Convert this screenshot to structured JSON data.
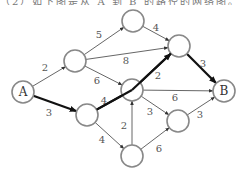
{
  "header": {
    "text": "（2）如下图是从 A 到 B 的路径的网络图。"
  },
  "graph": {
    "nodes": [
      {
        "id": "A",
        "label": "A",
        "x": 23,
        "y": 92
      },
      {
        "id": "N1",
        "label": "",
        "x": 75,
        "y": 61
      },
      {
        "id": "N2",
        "label": "",
        "x": 133,
        "y": 21
      },
      {
        "id": "N3",
        "label": "",
        "x": 179,
        "y": 46
      },
      {
        "id": "N4",
        "label": "",
        "x": 87,
        "y": 115
      },
      {
        "id": "N5",
        "label": "",
        "x": 132,
        "y": 90
      },
      {
        "id": "N6",
        "label": "",
        "x": 178,
        "y": 121
      },
      {
        "id": "N7",
        "label": "",
        "x": 132,
        "y": 156
      },
      {
        "id": "B",
        "label": "B",
        "x": 224,
        "y": 91
      }
    ],
    "edges": [
      {
        "from": "A",
        "to": "N1",
        "weight": "2",
        "bold": false,
        "lx": 45,
        "ly": 71
      },
      {
        "from": "N1",
        "to": "N2",
        "weight": "5",
        "bold": false,
        "lx": 99,
        "ly": 38
      },
      {
        "from": "N1",
        "to": "N3",
        "weight": "8",
        "bold": false,
        "lx": 126,
        "ly": 64
      },
      {
        "from": "N1",
        "to": "N5",
        "weight": "6",
        "bold": false,
        "lx": 97,
        "ly": 84
      },
      {
        "from": "N2",
        "to": "N3",
        "weight": "4",
        "bold": false,
        "lx": 156,
        "ly": 31
      },
      {
        "from": "A",
        "to": "N4",
        "weight": "3",
        "bold": true,
        "lx": 49,
        "ly": 116
      },
      {
        "from": "N4",
        "to": "N5",
        "weight": "4",
        "bold": true,
        "lx": 104,
        "ly": 104
      },
      {
        "from": "N5",
        "to": "N3",
        "weight": "2",
        "bold": true,
        "lx": 158,
        "ly": 79
      },
      {
        "from": "N3",
        "to": "B",
        "weight": "3",
        "bold": true,
        "lx": 203,
        "ly": 67
      },
      {
        "from": "N5",
        "to": "B",
        "weight": "6",
        "bold": false,
        "lx": 175,
        "ly": 101
      },
      {
        "from": "N5",
        "to": "N6",
        "weight": "3",
        "bold": false,
        "lx": 150,
        "ly": 115
      },
      {
        "from": "N6",
        "to": "B",
        "weight": "3",
        "bold": false,
        "lx": 200,
        "ly": 118
      },
      {
        "from": "N7",
        "to": "N5",
        "weight": "2",
        "bold": false,
        "lx": 124,
        "ly": 129
      },
      {
        "from": "N4",
        "to": "N7",
        "weight": "4",
        "bold": false,
        "lx": 102,
        "ly": 143
      },
      {
        "from": "N7",
        "to": "N6",
        "weight": "6",
        "bold": false,
        "lx": 159,
        "ly": 152
      }
    ],
    "colors": {
      "edge": "#555555",
      "bold_path": "#111111",
      "node_stroke": "#888888"
    }
  }
}
